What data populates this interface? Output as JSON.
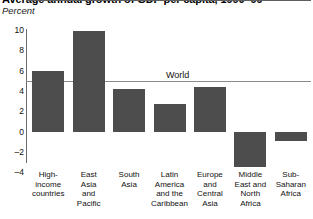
{
  "header": {
    "title": "Average annual growth of GDP per capita, 1990–99",
    "subtitle": "Percent"
  },
  "chart_data": {
    "type": "bar",
    "title": "Average annual growth of GDP per capita, 1990–99",
    "subtitle": "Percent",
    "xlabel": "",
    "ylabel": "Percent",
    "ylim": [
      -4,
      10
    ],
    "yticks": [
      10,
      8,
      6,
      4,
      2,
      0,
      -2,
      -4
    ],
    "ytick_labels": [
      "10",
      "8",
      "6",
      "4",
      "2",
      "0",
      "–2",
      "–4"
    ],
    "grid": false,
    "legend": "none",
    "bar_color": "#4d4d4d",
    "categories": [
      "High-\nincome\ncountries",
      "East\nAsia\nand\nPacific",
      "South\nAsia",
      "Latin\nAmerica\nand the\nCaribbean",
      "Europe\nand\nCentral\nAsia",
      "Middle\nEast and\nNorth\nAfrica",
      "Sub-\nSaharan\nAfrica"
    ],
    "values": [
      6.0,
      10.0,
      4.2,
      2.8,
      4.4,
      -3.4,
      -0.9
    ],
    "reference_line": {
      "label": "World",
      "value": 5.0
    }
  }
}
